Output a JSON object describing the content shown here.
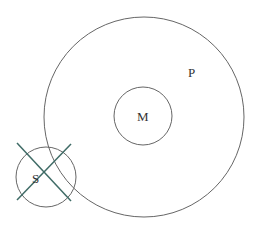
{
  "diagram": {
    "circles": [
      {
        "id": "outer",
        "cx": 144,
        "cy": 117,
        "r": 100,
        "stroke": "#666666"
      },
      {
        "id": "M",
        "cx": 143,
        "cy": 116,
        "r": 29,
        "stroke": "#666666"
      },
      {
        "id": "S",
        "cx": 46,
        "cy": 177,
        "r": 30,
        "stroke": "#666666"
      }
    ],
    "cross": {
      "stroke": "#3f6b66",
      "lines": [
        [
          17,
          143,
          71,
          201
        ],
        [
          71,
          144,
          17,
          200
        ]
      ]
    },
    "labels": {
      "p": "P",
      "m": "M",
      "s": "S"
    }
  }
}
